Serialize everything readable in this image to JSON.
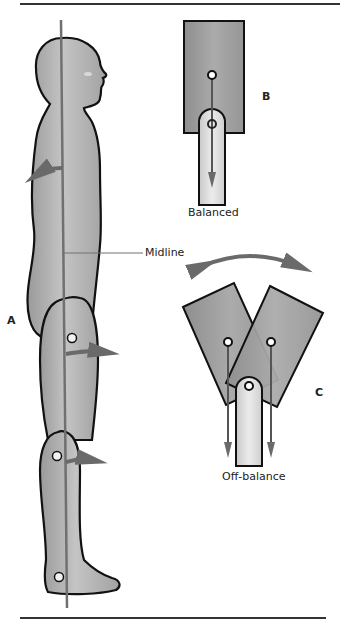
{
  "figure": {
    "panels": {
      "a": "A",
      "b": "B",
      "c": "C"
    },
    "labels": {
      "midline": "Midline",
      "balanced": "Balanced",
      "off_balance": "Off-balance"
    },
    "colors": {
      "body_fill": "#a8a8a8",
      "body_highlight": "#c8c8c8",
      "outline": "#111111",
      "midline_line": "#707070",
      "arrow": "#6a6a6a",
      "block_fill": "#9e9e9e",
      "post_fill": "#d6d6d6",
      "rule": "#333333"
    }
  }
}
